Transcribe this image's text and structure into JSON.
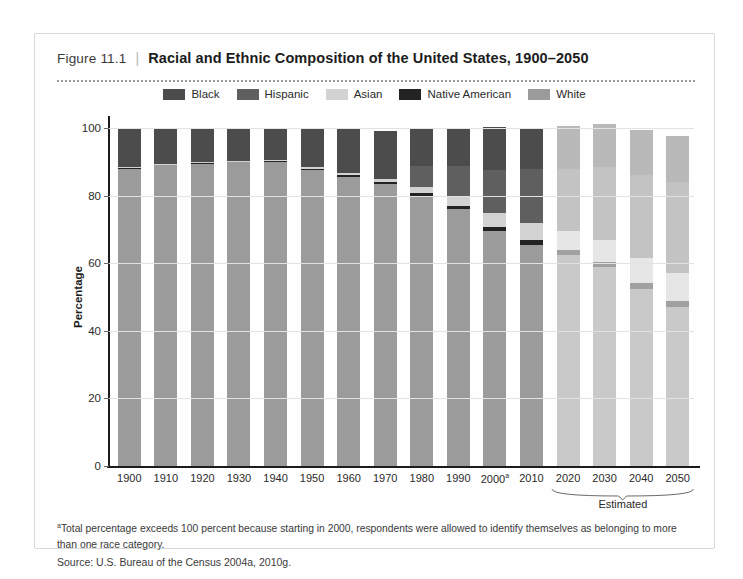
{
  "figure": {
    "number": "Figure 11.1",
    "separator": "|",
    "title": "Racial and Ethnic Composition of the United States, 1900–2050"
  },
  "footnote": {
    "marker": "a",
    "text": "Total percentage exceeds 100 percent because starting in 2000, respondents were allowed to identify themselves as belonging to more than one race category."
  },
  "source": "Source: U.S. Bureau of the Census 2004a, 2010g.",
  "estimated_label": "Estimated",
  "colors": {
    "black": "#4c4c4c",
    "hispanic": "#5f5f5f",
    "asian": "#d2d2d2",
    "native_american": "#232323",
    "white": "#9b9b9b",
    "black_est": "#b9b9b9",
    "hispanic_est": "#c3c3c3",
    "asian_est": "#e6e6e6",
    "native_american_est": "#a0a0a0",
    "white_est": "#c9c9c9",
    "axis": "#1c1c1c",
    "grid": "#e2e2e2"
  },
  "chart_data": {
    "type": "bar",
    "title": "Racial and Ethnic Composition of the United States, 1900–2050",
    "xlabel": "",
    "ylabel": "Percentage",
    "ylim": [
      0,
      100
    ],
    "yticks": [
      0,
      20,
      40,
      60,
      80,
      100
    ],
    "grid": true,
    "stacked": true,
    "legend_position": "top-center",
    "legend": [
      "Black",
      "Hispanic",
      "Asian",
      "Native American",
      "White"
    ],
    "categories": [
      "1900",
      "1910",
      "1920",
      "1930",
      "1940",
      "1950",
      "1960",
      "1970",
      "1980",
      "1990",
      "2000",
      "2010",
      "2020",
      "2030",
      "2040",
      "2050"
    ],
    "category_notes": {
      "2000": "a"
    },
    "estimated_categories": [
      "2020",
      "2030",
      "2040",
      "2050"
    ],
    "series": [
      {
        "name": "White",
        "values": [
          88.0,
          89.0,
          89.5,
          89.8,
          90.0,
          87.5,
          85.5,
          83.5,
          80.0,
          76.0,
          69.5,
          65.5,
          62.5,
          59.0,
          52.5,
          47.0
        ]
      },
      {
        "name": "Native American",
        "values": [
          0.3,
          0.3,
          0.3,
          0.3,
          0.3,
          0.4,
          0.5,
          0.5,
          0.7,
          0.8,
          1.3,
          1.3,
          1.4,
          1.5,
          1.6,
          1.7
        ]
      },
      {
        "name": "Asian",
        "values": [
          0.2,
          0.2,
          0.2,
          0.2,
          0.3,
          0.6,
          0.7,
          0.9,
          1.8,
          3.0,
          4.2,
          5.2,
          5.6,
          6.5,
          7.4,
          8.3
        ]
      },
      {
        "name": "Hispanic",
        "values": [
          0.0,
          0.0,
          0.0,
          0.0,
          0.0,
          0.0,
          0.0,
          0.0,
          6.4,
          9.0,
          12.5,
          16.0,
          18.5,
          21.5,
          24.5,
          27.0
        ]
      },
      {
        "name": "Black",
        "values": [
          11.5,
          10.5,
          10.0,
          9.7,
          9.4,
          11.5,
          13.3,
          14.1,
          11.1,
          11.2,
          12.9,
          12.0,
          12.5,
          12.8,
          13.3,
          13.7
        ]
      }
    ],
    "totals": [
      100.0,
      100.0,
      100.0,
      100.0,
      100.0,
      100.0,
      100.0,
      99.0,
      100.0,
      100.0,
      100.4,
      100.0,
      100.5,
      101.3,
      99.3,
      97.7
    ]
  }
}
